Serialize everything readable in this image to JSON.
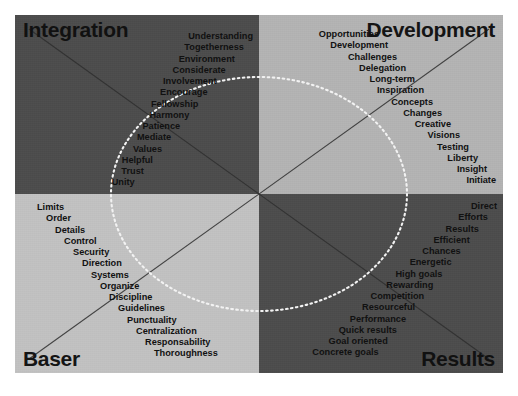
{
  "diagram": {
    "title_labels": {
      "top_left": "Integration",
      "top_right": "Development",
      "bottom_left": "Baser",
      "bottom_right": "Results"
    },
    "colors": {
      "quadrant_top_left": "#4c4c4c",
      "quadrant_top_right": "#b4b4b4",
      "quadrant_bottom_left": "#c2c2c2",
      "quadrant_bottom_right": "#4c4c4c",
      "text": "#111111",
      "ellipse_stroke": "#f0f0f0",
      "diagonal_stroke": "#2b2b2b",
      "page_background": "#ffffff"
    },
    "quadrants": {
      "integration": {
        "label": "Integration",
        "words": [
          "Understanding",
          "Togetherness",
          "Environment",
          "Considerate",
          "Involvement",
          "Encourage",
          "Fellowship",
          "Harmony",
          "Patience",
          "Mediate",
          "Values",
          "Helpful",
          "Trust",
          "Unity"
        ]
      },
      "development": {
        "label": "Development",
        "words": [
          "Opportunities",
          "Development",
          "Challenges",
          "Delegation",
          "Long-term",
          "Inspiration",
          "Concepts",
          "Changes",
          "Creative",
          "Visions",
          "Testing",
          "Liberty",
          "Insight",
          "Initiate"
        ]
      },
      "baser": {
        "label": "Baser",
        "words": [
          "Limits",
          "Order",
          "Details",
          "Control",
          "Security",
          "Direction",
          "Systems",
          "Organize",
          "Discipline",
          "Guidelines",
          "Punctuality",
          "Centralization",
          "Responsability",
          "Thoroughness"
        ]
      },
      "results": {
        "label": "Results",
        "words": [
          "Direct",
          "Efforts",
          "Results",
          "Efficient",
          "Chances",
          "Energetic",
          "High goals",
          "Rewarding",
          "Competition",
          "Resourceful",
          "Performance",
          "Quick results",
          "Goal oriented",
          "Concrete goals"
        ]
      }
    }
  }
}
